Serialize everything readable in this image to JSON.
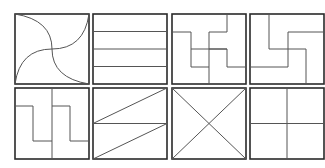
{
  "figure": {
    "rows": 2,
    "cols": 4,
    "colors": {
      "frame": "#2a2a2a",
      "line": "#555555",
      "background": "#ffffff"
    }
  },
  "tiles": [
    {
      "id": "curved-pinwheel",
      "x": 15,
      "y": 14,
      "w": 74,
      "h": 70
    },
    {
      "id": "horizontal-strips",
      "x": 93,
      "y": 14,
      "w": 74,
      "h": 70
    },
    {
      "id": "interlocking-t",
      "x": 172,
      "y": 14,
      "w": 74,
      "h": 70
    },
    {
      "id": "interlocking-l",
      "x": 250,
      "y": 14,
      "w": 74,
      "h": 70
    },
    {
      "id": "vertical-zigzag",
      "x": 15,
      "y": 88,
      "w": 74,
      "h": 71
    },
    {
      "id": "diagonal-strips",
      "x": 93,
      "y": 88,
      "w": 74,
      "h": 71
    },
    {
      "id": "diagonal-cross",
      "x": 172,
      "y": 88,
      "w": 74,
      "h": 71
    },
    {
      "id": "quadrants",
      "x": 250,
      "y": 88,
      "w": 74,
      "h": 71
    }
  ]
}
